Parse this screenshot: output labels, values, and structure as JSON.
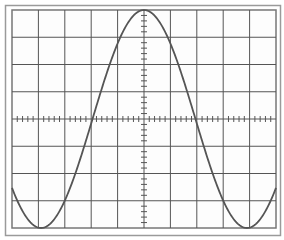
{
  "chart_data": {
    "type": "line",
    "title": "",
    "xlabel": "",
    "ylabel": "",
    "grid": true,
    "grid_divisions": {
      "x": 10,
      "y": 8
    },
    "axis_ticks": "minor ticks on center cross-hair (5 per division)",
    "legend": null,
    "xlim": [
      -5,
      5
    ],
    "ylim": [
      -4,
      4
    ],
    "series": [
      {
        "name": "cosine waveform",
        "function": "y = 4*cos(2*pi*x/7.8)",
        "x": [
          -5,
          -4,
          -3.9,
          -3,
          -2,
          -1.95,
          -1,
          0,
          1,
          1.95,
          2,
          3,
          3.9,
          4,
          5
        ],
        "values": [
          -2,
          -3.9,
          -4,
          -3.1,
          0.2,
          0,
          2.8,
          4,
          2.8,
          0,
          -0.2,
          -3.1,
          -4,
          -3.9,
          -2
        ]
      }
    ],
    "colors": {
      "background": "#ffffff",
      "frame": "#8a8a8a",
      "grid": "#555555",
      "trace": "#555555"
    }
  },
  "screen": {
    "label": "oscilloscope-style graticule"
  }
}
